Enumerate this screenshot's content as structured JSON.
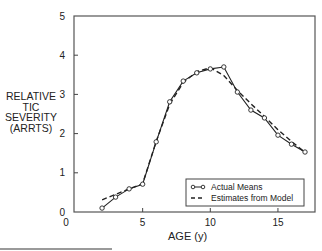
{
  "chart_data": {
    "type": "line",
    "title": "",
    "xlabel": "AGE (y)",
    "ylabel": [
      "RELATIVE",
      "TIC",
      "SEVERITY",
      "(ARRTS)"
    ],
    "xlim": [
      0,
      17.5
    ],
    "ylim": [
      0,
      5
    ],
    "x_ticks": [
      0,
      5,
      10,
      15
    ],
    "y_ticks": [
      0,
      1,
      2,
      3,
      4,
      5
    ],
    "grid": false,
    "legend_position": "lower right",
    "series": [
      {
        "name": "Actual Means",
        "style": "solid-open-circles",
        "x": [
          2,
          3,
          4,
          5,
          6,
          7,
          8,
          9,
          10,
          11,
          12,
          13,
          14,
          15,
          16,
          17
        ],
        "y": [
          0.1,
          0.38,
          0.59,
          0.71,
          1.79,
          2.81,
          3.34,
          3.55,
          3.65,
          3.7,
          3.06,
          2.6,
          2.4,
          1.96,
          1.73,
          1.53
        ]
      },
      {
        "name": "Estimates from Model",
        "style": "dashed",
        "x": [
          2,
          3,
          4,
          5,
          6,
          7,
          8,
          9,
          10,
          11,
          12,
          13,
          14,
          15,
          16,
          17
        ],
        "y": [
          0.31,
          0.45,
          0.59,
          0.72,
          1.8,
          2.75,
          3.3,
          3.58,
          3.68,
          3.48,
          3.1,
          2.76,
          2.44,
          2.1,
          1.8,
          1.52
        ]
      }
    ]
  },
  "axis_labels": {
    "y_lines": [
      "RELATIVE",
      "TIC",
      "SEVERITY",
      "(ARRTS)"
    ],
    "x": "AGE (y)"
  },
  "legend": {
    "items": [
      {
        "label": "Actual Means",
        "symbol": "line-with-open-circles"
      },
      {
        "label": "Estimates from Model",
        "symbol": "dashed-line"
      }
    ]
  },
  "colors": {
    "ink": "#222222",
    "frame": "#555555",
    "background": "#ffffff"
  }
}
